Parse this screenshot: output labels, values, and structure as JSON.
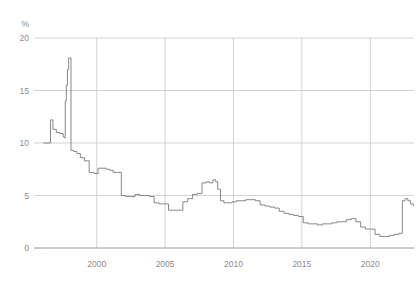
{
  "chart_data": {
    "type": "line",
    "title": "",
    "subtitle": "",
    "xlabel": "",
    "ylabel": "%",
    "unit_label": "%",
    "xlim": [
      1996.0,
      2023.2
    ],
    "ylim": [
      0,
      20
    ],
    "ytick_labels": [
      "0",
      "5",
      "10",
      "15",
      "20"
    ],
    "yticks": [
      0,
      5,
      10,
      15,
      20
    ],
    "xtick_labels": [
      "2000",
      "2005",
      "2010",
      "2015",
      "2020"
    ],
    "xticks": [
      2000,
      2005,
      2010,
      2015,
      2020
    ],
    "grid": true,
    "grid_axis": "both",
    "legend": false,
    "legend_position": "none",
    "line_color": "#7a7a7a",
    "grid_color": "#c8c8c8",
    "axis_color": "#9a9a9a",
    "text_color": "#8c8c8c",
    "background_color": "#ffffff",
    "step_style": "post",
    "series": [
      {
        "name": "policy rate",
        "x": [
          1996.1,
          1996.45,
          1996.62,
          1996.8,
          1997.05,
          1997.3,
          1997.55,
          1997.62,
          1997.7,
          1997.78,
          1997.86,
          1997.95,
          1998.02,
          1998.12,
          1998.3,
          1998.55,
          1998.8,
          1999.1,
          1999.45,
          1999.8,
          2000.1,
          2000.4,
          2000.7,
          2000.95,
          2001.2,
          2001.5,
          2001.8,
          2002.1,
          2002.45,
          2002.8,
          2003.15,
          2003.5,
          2003.85,
          2004.2,
          2004.55,
          2004.9,
          2005.25,
          2005.6,
          2005.95,
          2006.3,
          2006.65,
          2007.0,
          2007.35,
          2007.7,
          2008.0,
          2008.25,
          2008.5,
          2008.7,
          2008.85,
          2009.05,
          2009.3,
          2009.6,
          2009.9,
          2010.2,
          2010.55,
          2010.9,
          2011.25,
          2011.6,
          2011.95,
          2012.3,
          2012.65,
          2013.0,
          2013.35,
          2013.7,
          2014.05,
          2014.4,
          2014.75,
          2015.1,
          2015.45,
          2015.8,
          2016.15,
          2016.5,
          2016.85,
          2017.2,
          2017.55,
          2017.9,
          2018.25,
          2018.6,
          2018.95,
          2019.3,
          2019.65,
          2020.0,
          2020.35,
          2020.7,
          2021.05,
          2021.4,
          2021.75,
          2022.1,
          2022.35,
          2022.55,
          2022.75,
          2022.95,
          2023.15
        ],
        "values": [
          10.0,
          10.0,
          12.2,
          11.3,
          11.0,
          10.9,
          10.6,
          10.5,
          14.0,
          15.5,
          17.0,
          18.1,
          18.1,
          9.3,
          9.2,
          9.0,
          8.6,
          8.3,
          7.2,
          7.1,
          7.6,
          7.6,
          7.5,
          7.4,
          7.2,
          7.2,
          5.0,
          4.9,
          4.9,
          5.1,
          5.0,
          5.0,
          4.9,
          4.3,
          4.2,
          4.2,
          3.6,
          3.6,
          3.6,
          4.4,
          4.7,
          5.1,
          5.2,
          6.2,
          6.3,
          6.2,
          6.5,
          6.3,
          5.6,
          4.5,
          4.3,
          4.3,
          4.4,
          4.5,
          4.5,
          4.6,
          4.6,
          4.5,
          4.1,
          4.0,
          3.9,
          3.8,
          3.5,
          3.3,
          3.2,
          3.1,
          3.0,
          2.4,
          2.3,
          2.3,
          2.2,
          2.3,
          2.3,
          2.4,
          2.5,
          2.5,
          2.7,
          2.8,
          2.5,
          2.0,
          1.8,
          1.8,
          1.3,
          1.1,
          1.1,
          1.2,
          1.3,
          1.4,
          4.5,
          4.7,
          4.5,
          4.2,
          4.0
        ]
      }
    ]
  },
  "layout": {
    "plot_left": 42,
    "plot_right": 414,
    "plot_top": 38,
    "plot_bottom": 248
  }
}
